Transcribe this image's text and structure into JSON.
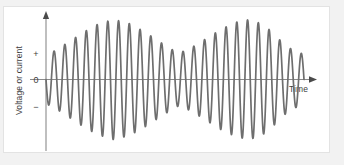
{
  "figure": {
    "panel_background": "#ffffff",
    "outer_background": "#f2f2f2",
    "border_color": "#e3e3e3",
    "axis_color": "#8a8a8a",
    "wave_color": "#6e6e6e",
    "text_color": "#3d3d3d"
  },
  "axes": {
    "y_axis_label": "Voltage or current",
    "x_axis_label": "Time",
    "y_ticks": [
      {
        "label": "+",
        "value": 1
      },
      {
        "label": "0",
        "value": 0
      },
      {
        "label": "−",
        "value": -1
      }
    ],
    "y_arrow": "up-arrow-icon",
    "x_arrow": "right-arrow-icon"
  },
  "chart_data": {
    "type": "line",
    "title": "",
    "xlabel": "Time",
    "ylabel": "Voltage or current",
    "xlim": [
      0,
      1
    ],
    "ylim": [
      -1.15,
      1.15
    ],
    "grid": false,
    "legend": null,
    "series": [
      {
        "name": "Amplitude modulated waveform",
        "carrier_cycles": 24,
        "envelope_nodes": [
          0.0,
          0.515,
          1.0
        ],
        "envelope_peaks": [
          {
            "x": 0.26,
            "amplitude": 1.0
          },
          {
            "x": 0.79,
            "amplitude": 1.0
          }
        ],
        "envelope_minimum": {
          "x": 0.515,
          "amplitude": 0.44
        },
        "start_phase": "negative-going",
        "envelope_points": [
          {
            "x": 0.0,
            "a": 0.4
          },
          {
            "x": 0.05,
            "a": 0.52
          },
          {
            "x": 0.1,
            "a": 0.66
          },
          {
            "x": 0.15,
            "a": 0.8
          },
          {
            "x": 0.2,
            "a": 0.92
          },
          {
            "x": 0.26,
            "a": 1.0
          },
          {
            "x": 0.32,
            "a": 0.94
          },
          {
            "x": 0.38,
            "a": 0.8
          },
          {
            "x": 0.44,
            "a": 0.63
          },
          {
            "x": 0.5,
            "a": 0.47
          },
          {
            "x": 0.515,
            "a": 0.44
          },
          {
            "x": 0.56,
            "a": 0.52
          },
          {
            "x": 0.62,
            "a": 0.68
          },
          {
            "x": 0.68,
            "a": 0.84
          },
          {
            "x": 0.74,
            "a": 0.96
          },
          {
            "x": 0.79,
            "a": 1.0
          },
          {
            "x": 0.84,
            "a": 0.92
          },
          {
            "x": 0.88,
            "a": 0.78
          },
          {
            "x": 0.92,
            "a": 0.6
          },
          {
            "x": 0.96,
            "a": 0.48
          },
          {
            "x": 1.0,
            "a": 0.42
          }
        ]
      }
    ]
  }
}
